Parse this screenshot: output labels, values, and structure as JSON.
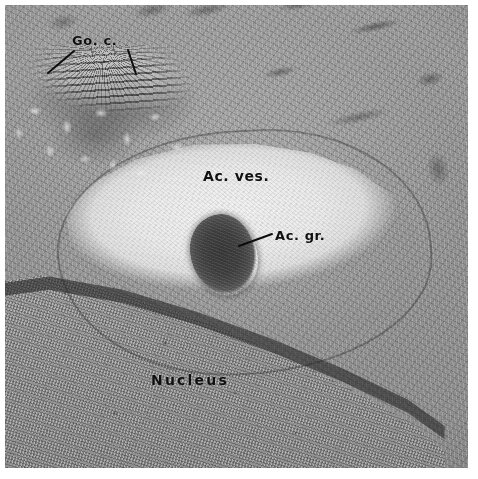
{
  "figure": {
    "kind": "transmission-electron-micrograph",
    "palette": {
      "plate_background": "#9a9a9a",
      "vesicle_light": "#f2f2f2",
      "granule_dark": "#3a3a3a",
      "nucleus_mid": "#9b9b9b",
      "label_text": "#101010",
      "page_background": "#ffffff"
    }
  },
  "labels": [
    {
      "id": "go-c",
      "text": "Go. c.",
      "meaning": "Golgi complex"
    },
    {
      "id": "ac-ves",
      "text": "Ac. ves.",
      "meaning": "Acrosomal vesicle"
    },
    {
      "id": "ac-gr",
      "text": "Ac. gr.",
      "meaning": "Acrosomal granule"
    },
    {
      "id": "nucleus",
      "text": "Nucleus",
      "meaning": "Nucleus"
    }
  ],
  "leader_lines": [
    {
      "id": "leader-goc-left",
      "from": [
        48,
        73
      ],
      "to": [
        74,
        51
      ],
      "for": "go-c"
    },
    {
      "id": "leader-goc-right",
      "from": [
        136,
        74
      ],
      "to": [
        128,
        50
      ],
      "for": "go-c"
    },
    {
      "id": "leader-acgr",
      "from": [
        239,
        246
      ],
      "to": [
        272,
        234
      ],
      "for": "ac-gr"
    }
  ],
  "regions": [
    {
      "id": "golgi-complex",
      "label": "Go. c.",
      "description": "Stacked, curved, electron-dense cisternae with associated small vesicles, upper left"
    },
    {
      "id": "acrosomal-vesicle",
      "label": "Ac. ves.",
      "description": "Large electron-lucent lens-shaped vesicle spanning the centre of the field"
    },
    {
      "id": "acrosomal-granule",
      "label": "Ac. gr.",
      "description": "Dense, homogeneous oval granule inside the acrosomal vesicle"
    },
    {
      "id": "nucleus",
      "label": "Nucleus",
      "description": "Finely granular chromatin occupying the lower-left half, bounded by the nuclear envelope"
    },
    {
      "id": "cytoplasm",
      "label": "",
      "description": "Membranous cytoplasm with endoplasmic reticulum profiles, upper and right"
    }
  ]
}
